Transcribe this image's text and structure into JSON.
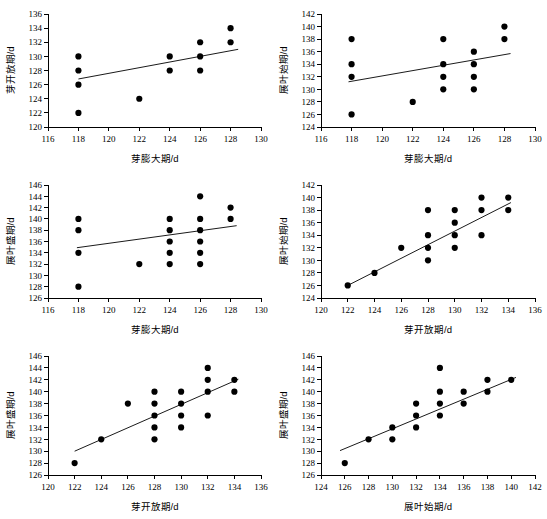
{
  "figure": {
    "background_color": "#ffffff",
    "marker_color": "#000000",
    "line_color": "#000000",
    "axis_color": "#000000",
    "panel_count": 6
  },
  "chart_data": [
    {
      "id": "panel-1",
      "type": "scatter",
      "title": "",
      "xlabel": "芽膨大期/d",
      "ylabel": "芽开放期/d",
      "xlim": [
        116,
        130
      ],
      "ylim": [
        120,
        136
      ],
      "xticks": [
        116,
        118,
        120,
        122,
        124,
        126,
        128,
        130
      ],
      "yticks": [
        120,
        122,
        124,
        126,
        128,
        130,
        132,
        134,
        136
      ],
      "grid": false,
      "legend": "none",
      "x": [
        118,
        118,
        118,
        118,
        122,
        124,
        124,
        126,
        126,
        126,
        128,
        128
      ],
      "y": [
        130,
        128,
        126,
        122,
        124,
        130,
        128,
        132,
        130,
        128,
        134,
        132
      ],
      "trendline": {
        "x0": 118,
        "y0": 126.8,
        "x1": 128.5,
        "y1": 131.0
      }
    },
    {
      "id": "panel-2",
      "type": "scatter",
      "title": "",
      "xlabel": "芽膨大期/d",
      "ylabel": "展叶始期/d",
      "xlim": [
        116,
        130
      ],
      "ylim": [
        124,
        142
      ],
      "xticks": [
        116,
        118,
        120,
        122,
        124,
        126,
        128,
        130
      ],
      "yticks": [
        124,
        126,
        128,
        130,
        132,
        134,
        136,
        138,
        140,
        142
      ],
      "grid": false,
      "legend": "none",
      "x": [
        118,
        118,
        118,
        118,
        122,
        124,
        124,
        124,
        124,
        126,
        126,
        126,
        126,
        128,
        128
      ],
      "y": [
        138,
        134,
        132,
        126,
        128,
        138,
        134,
        132,
        130,
        136,
        134,
        132,
        130,
        140,
        138
      ],
      "trendline": {
        "x0": 117.8,
        "y0": 131.2,
        "x1": 128.4,
        "y1": 135.7
      }
    },
    {
      "id": "panel-3",
      "type": "scatter",
      "title": "",
      "xlabel": "芽膨大期/d",
      "ylabel": "展叶盛期/d",
      "xlim": [
        116,
        130
      ],
      "ylim": [
        126,
        146
      ],
      "xticks": [
        116,
        118,
        120,
        122,
        124,
        126,
        128,
        130
      ],
      "yticks": [
        126,
        128,
        130,
        132,
        134,
        136,
        138,
        140,
        142,
        144,
        146
      ],
      "grid": false,
      "legend": "none",
      "x": [
        118,
        118,
        118,
        118,
        122,
        124,
        124,
        124,
        124,
        124,
        126,
        126,
        126,
        126,
        126,
        126,
        128,
        128
      ],
      "y": [
        140,
        138,
        134,
        128,
        132,
        140,
        138,
        136,
        134,
        132,
        144,
        140,
        138,
        136,
        134,
        132,
        142,
        140
      ],
      "trendline": {
        "x0": 117.9,
        "y0": 134.9,
        "x1": 128.4,
        "y1": 138.8
      }
    },
    {
      "id": "panel-4",
      "type": "scatter",
      "title": "",
      "xlabel": "芽开放期/d",
      "ylabel": "展叶始期/d",
      "xlim": [
        120,
        136
      ],
      "ylim": [
        124,
        142
      ],
      "xticks": [
        120,
        122,
        124,
        126,
        128,
        130,
        132,
        134,
        136
      ],
      "yticks": [
        124,
        126,
        128,
        130,
        132,
        134,
        136,
        138,
        140,
        142
      ],
      "grid": false,
      "legend": "none",
      "x": [
        122,
        124,
        126,
        128,
        128,
        128,
        128,
        130,
        130,
        130,
        130,
        132,
        132,
        132,
        134,
        134
      ],
      "y": [
        126,
        128,
        132,
        138,
        134,
        132,
        130,
        138,
        136,
        134,
        132,
        140,
        138,
        134,
        140,
        138
      ],
      "trendline": {
        "x0": 122,
        "y0": 126.0,
        "x1": 134.2,
        "y1": 139.2
      }
    },
    {
      "id": "panel-5",
      "type": "scatter",
      "title": "",
      "xlabel": "芽开放期/d",
      "ylabel": "展叶盛期/d",
      "xlim": [
        120,
        136
      ],
      "ylim": [
        126,
        146
      ],
      "xticks": [
        120,
        122,
        124,
        126,
        128,
        130,
        132,
        134,
        136
      ],
      "yticks": [
        126,
        128,
        130,
        132,
        134,
        136,
        138,
        140,
        142,
        144,
        146
      ],
      "grid": false,
      "legend": "none",
      "x": [
        122,
        124,
        126,
        128,
        128,
        128,
        128,
        128,
        130,
        130,
        130,
        130,
        132,
        132,
        132,
        132,
        134,
        134
      ],
      "y": [
        128,
        132,
        138,
        140,
        138,
        136,
        134,
        132,
        140,
        138,
        136,
        134,
        144,
        142,
        140,
        136,
        142,
        140
      ],
      "trendline": {
        "x0": 122,
        "y0": 130.0,
        "x1": 134.3,
        "y1": 142.1
      }
    },
    {
      "id": "panel-6",
      "type": "scatter",
      "title": "",
      "xlabel": "展叶始期/d",
      "ylabel": "展叶盛期/d",
      "xlim": [
        124,
        142
      ],
      "ylim": [
        126,
        146
      ],
      "xticks": [
        124,
        126,
        128,
        130,
        132,
        134,
        136,
        138,
        140,
        142
      ],
      "yticks": [
        126,
        128,
        130,
        132,
        134,
        136,
        138,
        140,
        142,
        144,
        146
      ],
      "grid": false,
      "legend": "none",
      "x": [
        126,
        128,
        130,
        130,
        132,
        132,
        132,
        134,
        134,
        134,
        134,
        136,
        136,
        138,
        138,
        140
      ],
      "y": [
        128,
        132,
        134,
        132,
        138,
        136,
        134,
        144,
        140,
        138,
        136,
        140,
        138,
        142,
        140,
        142
      ],
      "trendline": {
        "x0": 125.6,
        "y0": 130.1,
        "x1": 140.4,
        "y1": 142.4
      }
    }
  ]
}
